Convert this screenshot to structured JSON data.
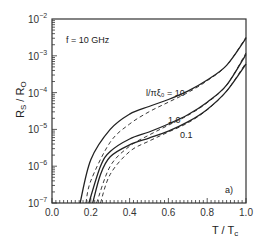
{
  "chart_data": {
    "type": "line",
    "title": "",
    "annotation_freq": "f = 10 GHz",
    "panel_label": "a)",
    "xlabel": "T / T_c",
    "ylabel": "R_s / R_0",
    "xlim": [
      0.0,
      1.0
    ],
    "ylim": [
      1e-07,
      0.01
    ],
    "yscale": "log",
    "grid": false,
    "legend": "inline labels",
    "x_ticks": [
      "0.0",
      "0.2",
      "0.4",
      "0.6",
      "0.8",
      "1.0"
    ],
    "y_ticks": [
      {
        "base": "10",
        "exp": "-2"
      },
      {
        "base": "10",
        "exp": "-3"
      },
      {
        "base": "10",
        "exp": "-4"
      },
      {
        "base": "10",
        "exp": "-5"
      },
      {
        "base": "10",
        "exp": "-6"
      },
      {
        "base": "10",
        "exp": "-7"
      }
    ],
    "series": [
      {
        "name": "l/πξ₀ = 10 (solid)",
        "label": "l/πξ₀ = 10",
        "style": "solid",
        "x": [
          0.145,
          0.2,
          0.3,
          0.4,
          0.5,
          0.6,
          0.7,
          0.8,
          0.9,
          1.0
        ],
        "values": [
          1e-07,
          1.5e-06,
          1e-05,
          2.6e-05,
          4.2e-05,
          6.5e-05,
          0.00011,
          0.00022,
          0.00055,
          0.003
        ]
      },
      {
        "name": "l/πξ₀ = 10 (dashed)",
        "label": "",
        "style": "dashed",
        "x": [
          0.175,
          0.2,
          0.3,
          0.4,
          0.5,
          0.6,
          0.7,
          0.8,
          0.9,
          1.0
        ],
        "values": [
          1e-07,
          4e-07,
          4.5e-06,
          1.4e-05,
          3e-05,
          5.5e-05,
          0.0001,
          0.00021,
          0.00055,
          0.0032
        ]
      },
      {
        "name": "l/πξ₀ = 1.0 (solid)",
        "label": "1.0",
        "style": "solid",
        "x": [
          0.19,
          0.25,
          0.3,
          0.4,
          0.5,
          0.6,
          0.7,
          0.8,
          0.9,
          1.0
        ],
        "values": [
          1e-07,
          1e-06,
          2.5e-06,
          5.5e-06,
          8.5e-06,
          1.4e-05,
          2.5e-05,
          5.5e-05,
          0.00016,
          0.0011
        ]
      },
      {
        "name": "l/πξ₀ = 1.0 (dashed)",
        "label": "",
        "style": "dashed",
        "x": [
          0.23,
          0.3,
          0.4,
          0.5,
          0.6,
          0.7,
          0.8,
          0.9,
          1.0
        ],
        "values": [
          1e-07,
          1e-06,
          3.5e-06,
          7e-06,
          1.3e-05,
          2.4e-05,
          5.3e-05,
          0.00016,
          0.0012
        ]
      },
      {
        "name": "l/πξ₀ = 0.1 (solid)",
        "label": "0.1",
        "style": "solid",
        "x": [
          0.21,
          0.25,
          0.3,
          0.4,
          0.5,
          0.6,
          0.7,
          0.8,
          0.9,
          1.0
        ],
        "values": [
          1e-07,
          6e-07,
          1.8e-06,
          3.8e-06,
          5.8e-06,
          9e-06,
          1.6e-05,
          3.5e-05,
          0.00011,
          0.0006
        ]
      },
      {
        "name": "l/πξ₀ = 0.1 (dashed)",
        "label": "",
        "style": "dashed",
        "x": [
          0.25,
          0.3,
          0.4,
          0.5,
          0.6,
          0.7,
          0.8,
          0.9,
          1.0
        ],
        "values": [
          1e-07,
          6e-07,
          2.5e-06,
          4.8e-06,
          8.5e-06,
          1.5e-05,
          3.4e-05,
          0.00011,
          0.00065
        ]
      }
    ]
  }
}
